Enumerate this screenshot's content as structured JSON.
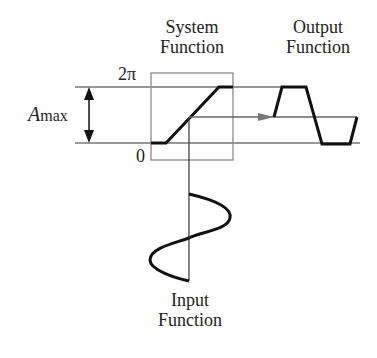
{
  "labels": {
    "system_function": [
      "System",
      "Function"
    ],
    "output_function": [
      "Output",
      "Function"
    ],
    "input_function": [
      "Input",
      "Function"
    ],
    "two_pi": "2π",
    "zero": "0",
    "amax_main": "A",
    "amax_sub": "max"
  },
  "colors": {
    "curve": "#111111",
    "guide": "#777777",
    "box": "#8a8a8a",
    "text": "#222222"
  }
}
